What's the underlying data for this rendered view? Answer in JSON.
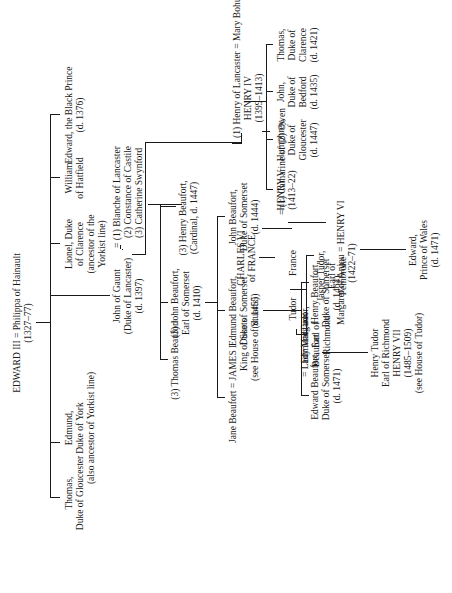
{
  "chart_title": "",
  "nodes": {
    "edward3": {
      "line1": "EDWARD III = Philippa of Hainault",
      "line2": "(1327–77)"
    },
    "black_prince": {
      "line1": "Edward, the Black Prince",
      "line2": "(d. 1376)"
    },
    "william": {
      "line1": "William",
      "line2": "of Hatfield"
    },
    "lionel": {
      "line1": "Lionel, Duke",
      "line2": "of Clarence",
      "line3": "(ancestor of the",
      "line4": "Yorkist line)"
    },
    "gaunt": {
      "line1": "John of Gaunt",
      "line2": "(Duke of Lancaster)",
      "line3": "(d. 1397)"
    },
    "gaunt_wives": {
      "line1": "= (1) Blanche of Lancaster",
      "line2": "(2) Constance of Castile",
      "line3": "(3) Catherine Swynford"
    },
    "edmund_york": {
      "line1": "Edmund,",
      "line2": "Duke of York",
      "line3": "(also ancestor of Yorkist line)"
    },
    "thomas_gloucester": {
      "line1": "Thomas,",
      "line2": "Duke of Gloucester"
    },
    "henry4": {
      "line1": "(1) Henry of Lancaster = Mary Bohun",
      "line2": "HENRY IV",
      "line3": "(1399–1413)"
    },
    "henry_beaufort_cardinal": {
      "line1": "(3) Henry Beaufort,",
      "line2": "(Cardinal, d. 1447)"
    },
    "john_beaufort_earl": {
      "line1": "(3) John Beaufort,",
      "line2": "Earl of Somerset",
      "line3": "(d. 1410)"
    },
    "thomas_beaufort": {
      "line1": "(3) Thomas Beaufort"
    },
    "thomas_clarence": {
      "line1": "Thomas,",
      "line2": "Duke of",
      "line3": "Clarence",
      "line4": "(d. 1421)"
    },
    "john_bedford": {
      "line1": "John,",
      "line2": "Duke of",
      "line3": "Bedford",
      "line4": "(d. 1435)"
    },
    "humphrey": {
      "line1": "Humphrey,",
      "line2": "Duke of",
      "line3": "Gloucester",
      "line4": "(d. 1447)"
    },
    "henry5": {
      "line1": "HENRY V",
      "line2": "(1413–22)"
    },
    "charles6": {
      "line1": "CHARLES VI",
      "line2": "of FRANCE"
    },
    "catharine": {
      "line1": "= (1) Catharine of (2) Owen",
      "line2": "France",
      "line3": "Tudor"
    },
    "john_beaufort_duke": {
      "line1": "John Beaufort,",
      "line2": "Duke of Somerset",
      "line3": "(d. 1444)"
    },
    "edmund_beaufort": {
      "line1": "Edmund Beaufort,",
      "line2": "Duke of Somerset",
      "line3": "(d. 1455)"
    },
    "jane_beaufort": {
      "line1": "Jane Beaufort = JAMES I",
      "line2": "King of Scots",
      "line3": "(see House of Stuarts)"
    },
    "henry6": {
      "line1": "Margaret of Anjou = HENRY VI",
      "line2": "(1422–71)"
    },
    "jasper": {
      "line1": "Jasper Tudor,",
      "line2": "Earl of",
      "line3": "Pembroke"
    },
    "edmund_tudor": {
      "line1": "EdmundTudor,",
      "line2": "Earl of",
      "line3": "Richmond"
    },
    "lady_margaret": {
      "line1": "= Lady Margaret",
      "line2": "Beaufort"
    },
    "henry_beaufort_duke": {
      "line1": "Henry Beaufort,",
      "line2": "Duke of Somerset",
      "line3": "(d. 1464)"
    },
    "edward_beaufort": {
      "line1": "Edward Beaufort,",
      "line2": "Duke of Somerset",
      "line3": "(d. 1471)"
    },
    "edward_wales": {
      "line1": "Edward,",
      "line2": "Prince of Wales",
      "line3": "(d. 1471)"
    },
    "henry7": {
      "line1": "Henry Tudor",
      "line2": "Earl of Richmond",
      "line3": "HENRY VII",
      "line4": "(1485–1509)",
      "line5": "(see House of Tudor)"
    }
  },
  "colors": {
    "ink": "#1a1a1a",
    "paper": "#ffffff"
  }
}
